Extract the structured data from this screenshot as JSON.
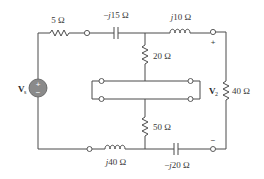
{
  "diagram": {
    "type": "circuit",
    "source": {
      "label": "V",
      "subscript": "s",
      "plus": "+",
      "minus": "−",
      "fill": "#8a8a8a"
    },
    "output": {
      "label": "V",
      "subscript": "2",
      "plus": "+",
      "minus": "−"
    },
    "components": [
      {
        "id": "r5",
        "kind": "resistor",
        "label": "5 Ω"
      },
      {
        "id": "c15",
        "kind": "capacitor",
        "label_prefix": "−",
        "label_j": "j",
        "label_rest": "15 Ω"
      },
      {
        "id": "l10",
        "kind": "inductor",
        "label_j": "j",
        "label_rest": "10 Ω"
      },
      {
        "id": "r20",
        "kind": "resistor",
        "label": "20 Ω"
      },
      {
        "id": "r50",
        "kind": "resistor",
        "label": "50 Ω"
      },
      {
        "id": "r40",
        "kind": "resistor",
        "label": "40 Ω"
      },
      {
        "id": "l40",
        "kind": "inductor",
        "label_j": "j",
        "label_rest": "40 Ω"
      },
      {
        "id": "c20",
        "kind": "capacitor",
        "label_prefix": "−",
        "label_j": "j",
        "label_rest": "20 Ω"
      }
    ],
    "colors": {
      "wire": "#4a4a4a",
      "text": "#3a3a3a",
      "source_fill": "#8a8a8a"
    }
  }
}
